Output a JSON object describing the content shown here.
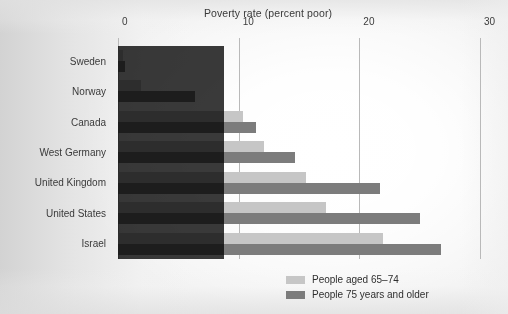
{
  "chart_data": {
    "type": "bar",
    "orientation": "horizontal",
    "title": "Poverty rate (percent poor)",
    "xlabel": "",
    "ylabel": "",
    "xlim": [
      0,
      30
    ],
    "xticks": [
      0,
      10,
      20,
      30
    ],
    "xtick_labels": [
      "0",
      "10",
      "20",
      "30"
    ],
    "grid": true,
    "legend_position": "bottom-right",
    "categories": [
      "Sweden",
      "Norway",
      "Canada",
      "West Germany",
      "United Kingdom",
      "United States",
      "Israel"
    ],
    "series": [
      {
        "name": "People aged 65–74",
        "color": "#c6c6c6",
        "values": [
          0.4,
          1.9,
          10.4,
          12.1,
          15.6,
          17.2,
          22.0
        ]
      },
      {
        "name": "People 75 years and older",
        "color": "#7c7c7c",
        "values": [
          0.6,
          6.4,
          11.4,
          14.7,
          21.7,
          25.0,
          26.8
        ]
      }
    ],
    "legend": [
      {
        "label": "People aged 65–74",
        "swatch": "#c6c6c6"
      },
      {
        "label": "People 75 years and older",
        "swatch": "#7c7c7c"
      }
    ],
    "annotations": [
      {
        "name": "dark-highlight-region",
        "description": "dark rectangular shading overlaying the plot from 0 to about 9 percent across all rows",
        "x_start": 0,
        "x_end": 9,
        "color": "#3a3a3a"
      }
    ]
  },
  "colors": {
    "series_light": "#c6c6c6",
    "series_dark": "#7c7c7c",
    "overlay": "#3a3a3a",
    "gridline": "#b9b9b9",
    "text": "#3a3a3a",
    "page_background": "#f3f3f3"
  }
}
